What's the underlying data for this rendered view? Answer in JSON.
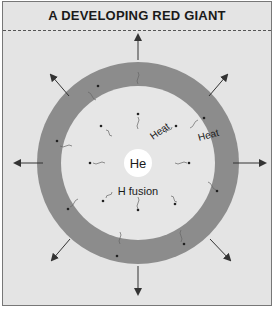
{
  "title": "A DEVELOPING RED GIANT",
  "labels": {
    "core": "He",
    "shell": "H fusion",
    "heat_inner": "Heat",
    "heat_outer": "Heat"
  },
  "colors": {
    "background": "#e4e4e4",
    "envelope": "#8c8c8c",
    "interior": "#e6e6e6",
    "core": "#ffffff",
    "arrow": "#333333"
  }
}
